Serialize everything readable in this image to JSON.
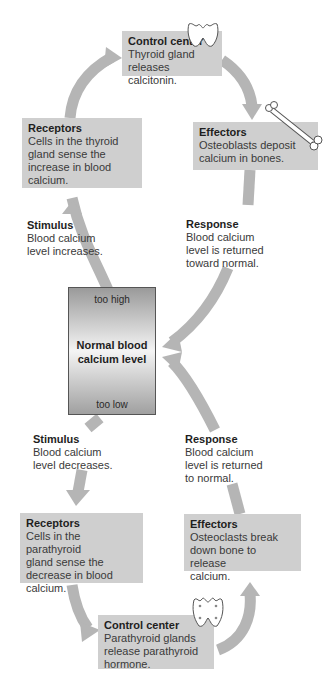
{
  "diagram": {
    "upper_loop": {
      "control_center": {
        "title": "Control center",
        "text": "Thyroid gland\nreleases calcitonin.",
        "icon": "thyroid-gland-icon"
      },
      "effectors": {
        "title": "Effectors",
        "text": "Osteoblasts deposit\ncalcium in bones.",
        "icon": "bone-icon"
      },
      "receptors": {
        "title": "Receptors",
        "text": "Cells in the thyroid\ngland sense the\nincrease in blood\ncalcium."
      },
      "stimulus": {
        "title": "Stimulus",
        "text": "Blood calcium\nlevel increases."
      },
      "response": {
        "title": "Response",
        "text": "Blood calcium\nlevel is returned\ntoward normal."
      }
    },
    "center": {
      "too_high": "too high",
      "label": "Normal blood\ncalcium level",
      "too_low": "too low"
    },
    "lower_loop": {
      "stimulus": {
        "title": "Stimulus",
        "text": "Blood calcium\nlevel decreases."
      },
      "response": {
        "title": "Response",
        "text": "Blood calcium\nlevel is returned\nto normal."
      },
      "receptors": {
        "title": "Receptors",
        "text": "Cells in the parathyroid\ngland sense the\ndecrease in blood\ncalcium."
      },
      "effectors": {
        "title": "Effectors",
        "text": "Osteoclasts break\ndown bone to release\ncalcium."
      },
      "control_center": {
        "title": "Control center",
        "text": "Parathyroid glands\nrelease parathyroid\nhormone.",
        "icon": "parathyroid-gland-icon"
      }
    },
    "colors": {
      "box_fill": "#cfcfcf",
      "arrow": "#b3b3b3",
      "text": "#2a2a2a"
    }
  }
}
